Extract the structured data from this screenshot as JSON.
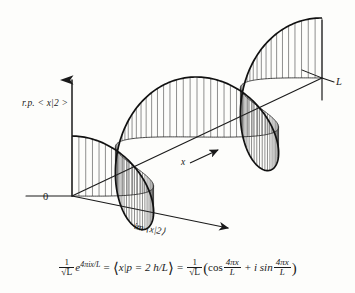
{
  "figure": {
    "title_present": false,
    "background_color": "#fdfdfb",
    "ink_color": "#1a1a1a",
    "width": 355,
    "height": 293
  },
  "axes": {
    "vertical": {
      "name": "real-part-axis",
      "label_prefix": "r.p.",
      "label_ket": "< x|2 >",
      "label_full": "r.p. < x|2 >",
      "arrow": "up"
    },
    "depth": {
      "name": "imaginary-part-axis",
      "label_prefix": "im",
      "label_ket": "⟨x|2⟩",
      "label_full": "im ⟨x|2⟩",
      "arrow": "down-right"
    },
    "horizontal": {
      "name": "position-axis",
      "label": "x",
      "end_label": "L",
      "arrow": "up-right"
    },
    "origin_label": "0"
  },
  "equation": {
    "lhs_coeff_num": "1",
    "lhs_coeff_den": "√L",
    "exponential_base": "e",
    "exponential_exponent": "4πix/L",
    "equals_1": "=",
    "braket": "x|p = 2 h/L",
    "equals_2": "=",
    "rhs_coeff_num": "1",
    "rhs_coeff_den": "√L",
    "rhs_open": "(",
    "cos_label": "cos",
    "cos_num": "4πx",
    "cos_den": "L",
    "plus": "+",
    "i_sin": "i sin",
    "sin_num": "4πx",
    "sin_den": "L",
    "rhs_close": ")"
  },
  "chart_data": {
    "type": "line",
    "title": "",
    "xlabel": "x",
    "ylabel": "r.p. < x|2 >",
    "zlabel": "im ⟨x|2⟩",
    "function": "(1/sqrt(L)) * exp(4*pi*i*x/L)",
    "cycles": 2,
    "x_domain": [
      0,
      1
    ],
    "x_domain_labels": [
      "0",
      "L"
    ],
    "real_part": "cos(4*pi*x/L)",
    "imag_part": "sin(4*pi*x/L)",
    "grid": false,
    "legend": false,
    "hatching": "vertical-lines",
    "samples_x": [
      0,
      0.05,
      0.1,
      0.15,
      0.2,
      0.25,
      0.3,
      0.35,
      0.4,
      0.45,
      0.5,
      0.55,
      0.6,
      0.65,
      0.7,
      0.75,
      0.8,
      0.85,
      0.9,
      0.95,
      1
    ],
    "samples_real": [
      1,
      0.809,
      0.309,
      -0.309,
      -0.809,
      -1,
      -0.809,
      -0.309,
      0.309,
      0.809,
      1,
      0.809,
      0.309,
      -0.309,
      -0.809,
      -1,
      -0.809,
      -0.309,
      0.309,
      0.809,
      1
    ],
    "samples_imag": [
      0,
      0.588,
      0.951,
      0.951,
      0.588,
      0,
      -0.588,
      -0.951,
      -0.951,
      -0.588,
      0,
      0.588,
      0.951,
      0.951,
      0.588,
      0,
      -0.588,
      -0.951,
      -0.951,
      -0.588,
      0
    ]
  }
}
